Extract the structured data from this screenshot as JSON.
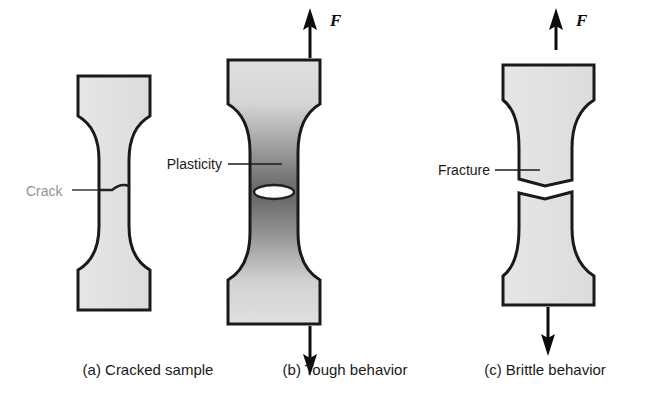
{
  "figure": {
    "background_color": "#ffffff",
    "outline_color": "#1a1a1a",
    "specimen_fill_light": "#e3e3e3",
    "plastic_zone_dark": "#6b6b6b"
  },
  "captions": [
    {
      "id": "a",
      "text": "(a) Cracked sample"
    },
    {
      "id": "b",
      "text": "(b) Tough behavior"
    },
    {
      "id": "c",
      "text": "(c) Brittle behavior"
    }
  ],
  "annotations": [
    {
      "id": "crack",
      "text": "Crack",
      "note": "faded scan artifact"
    },
    {
      "id": "plasticity",
      "text": "Plasticity"
    },
    {
      "id": "fracture",
      "text": "Fracture"
    }
  ],
  "force_labels": [
    {
      "id": "force-b-top",
      "text": "F"
    },
    {
      "id": "force-c-top",
      "text": "F"
    }
  ],
  "panels": [
    {
      "id": "a",
      "caption": "(a) Cracked sample",
      "state": "intact dogbone specimen with horizontal through-crack at mid gauge",
      "loaded": false,
      "fill": "uniform light gray",
      "crack_type": "sharp horizontal crack"
    },
    {
      "id": "b",
      "caption": "(b) Tough behavior",
      "state": "intact specimen under tension with blunted crack opening",
      "loaded": true,
      "fill": "dark gradient plastic zone concentrated at mid gauge",
      "crack_type": "blunted elliptical opening"
    },
    {
      "id": "c",
      "caption": "(c) Brittle behavior",
      "state": "specimen separated into two halves along jagged fracture surface",
      "loaded": true,
      "fill": "uniform light gray",
      "crack_type": "complete fracture separation"
    }
  ]
}
